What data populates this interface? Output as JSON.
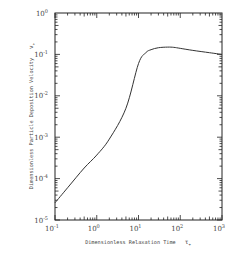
{
  "chart_data": {
    "type": "line",
    "title": "",
    "xlabel": "Dimensionless Relaxation Time",
    "xlabel_symbol": "τ+",
    "ylabel": "Dimensionless Particle Deposition Velocity",
    "ylabel_symbol": "v+",
    "xscale": "log",
    "yscale": "log",
    "xlim": [
      0.1,
      1000
    ],
    "ylim": [
      1e-05,
      1
    ],
    "x_tick_labels": [
      "10^-1",
      "10^0",
      "10^1",
      "10^2",
      "10^3"
    ],
    "y_tick_labels": [
      "10^0",
      "10^-1",
      "10^-2",
      "10^-3",
      "10^-4",
      "10^-5"
    ],
    "grid": false,
    "legend": null,
    "series": [
      {
        "name": "deposition velocity",
        "x": [
          0.1,
          0.2,
          0.5,
          1,
          2,
          5,
          10,
          15,
          20,
          30,
          50,
          70,
          100,
          200,
          500,
          1000
        ],
        "y": [
          2.6e-05,
          6e-05,
          0.00018,
          0.00037,
          0.0009,
          0.005,
          0.06,
          0.11,
          0.13,
          0.145,
          0.15,
          0.148,
          0.14,
          0.125,
          0.11,
          0.1
        ]
      }
    ]
  },
  "axes": {
    "x_ticks": [
      {
        "label_base": "10",
        "label_exp": "-1"
      },
      {
        "label_base": "10",
        "label_exp": "0"
      },
      {
        "label_base": "10",
        "label_exp": "1"
      },
      {
        "label_base": "10",
        "label_exp": "2"
      },
      {
        "label_base": "10",
        "label_exp": "3"
      }
    ],
    "y_ticks": [
      {
        "label_base": "10",
        "label_exp": "0"
      },
      {
        "label_base": "10",
        "label_exp": "-1"
      },
      {
        "label_base": "10",
        "label_exp": "-2"
      },
      {
        "label_base": "10",
        "label_exp": "-3"
      },
      {
        "label_base": "10",
        "label_exp": "-4"
      },
      {
        "label_base": "10",
        "label_exp": "-5"
      }
    ],
    "x_title": "Dimensionless Relaxation Time",
    "x_symbol": "τ",
    "x_symbol_sub": "+",
    "y_title": "Dimensionless Particle Deposition Velocity",
    "y_symbol": "v",
    "y_symbol_sub": "+"
  },
  "colors": {
    "line": "#333333",
    "axis": "#222222",
    "background": "#ffffff"
  }
}
